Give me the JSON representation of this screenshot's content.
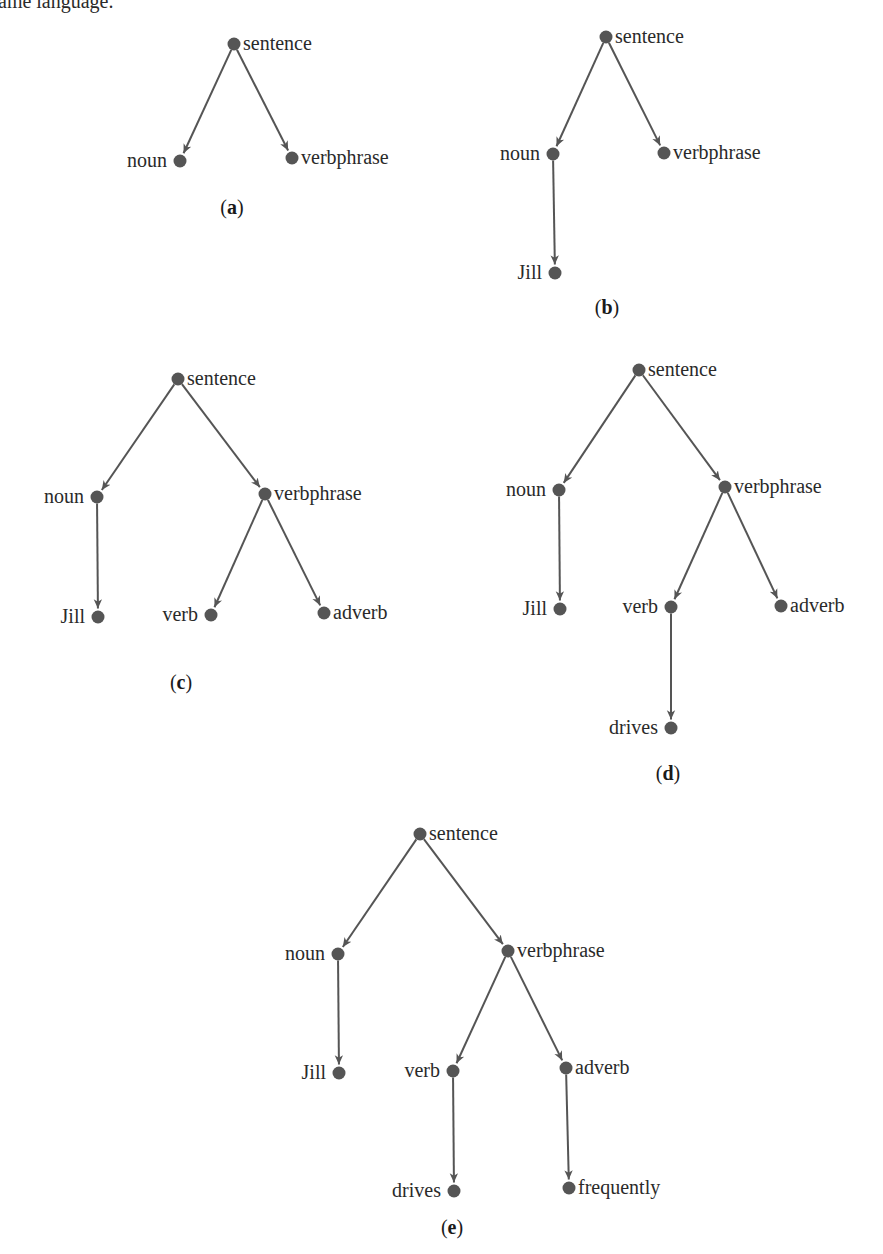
{
  "top_text": "ame language.",
  "colors": {
    "edge": "#555555",
    "node": "#555555",
    "text": "#2a2a2a"
  },
  "trees": [
    {
      "id": "a",
      "caption": "a",
      "caption_pos": [
        232,
        208
      ],
      "nodes": [
        {
          "id": "sentence",
          "label": "sentence",
          "x": 234,
          "y": 44,
          "side": "right"
        },
        {
          "id": "noun",
          "label": "noun",
          "x": 180,
          "y": 161,
          "side": "left"
        },
        {
          "id": "verbphrase",
          "label": "verbphrase",
          "x": 292,
          "y": 158,
          "side": "right"
        }
      ],
      "edges": [
        [
          "sentence",
          "noun"
        ],
        [
          "sentence",
          "verbphrase"
        ]
      ]
    },
    {
      "id": "b",
      "caption": "b",
      "caption_pos": [
        607,
        308
      ],
      "nodes": [
        {
          "id": "sentence",
          "label": "sentence",
          "x": 606,
          "y": 37,
          "side": "right"
        },
        {
          "id": "noun",
          "label": "noun",
          "x": 553,
          "y": 154,
          "side": "left"
        },
        {
          "id": "verbphrase",
          "label": "verbphrase",
          "x": 664,
          "y": 153,
          "side": "right"
        },
        {
          "id": "jill",
          "label": "Jill",
          "x": 555,
          "y": 273,
          "side": "left"
        }
      ],
      "edges": [
        [
          "sentence",
          "noun"
        ],
        [
          "sentence",
          "verbphrase"
        ],
        [
          "noun",
          "jill"
        ]
      ]
    },
    {
      "id": "c",
      "caption": "c",
      "caption_pos": [
        181,
        683
      ],
      "nodes": [
        {
          "id": "sentence",
          "label": "sentence",
          "x": 178,
          "y": 379,
          "side": "right"
        },
        {
          "id": "noun",
          "label": "noun",
          "x": 97,
          "y": 497,
          "side": "left"
        },
        {
          "id": "verbphrase",
          "label": "verbphrase",
          "x": 265,
          "y": 494,
          "side": "right"
        },
        {
          "id": "jill",
          "label": "Jill",
          "x": 98,
          "y": 617,
          "side": "left"
        },
        {
          "id": "verb",
          "label": "verb",
          "x": 211,
          "y": 615,
          "side": "left"
        },
        {
          "id": "adverb",
          "label": "adverb",
          "x": 324,
          "y": 613,
          "side": "right"
        }
      ],
      "edges": [
        [
          "sentence",
          "noun"
        ],
        [
          "sentence",
          "verbphrase"
        ],
        [
          "noun",
          "jill"
        ],
        [
          "verbphrase",
          "verb"
        ],
        [
          "verbphrase",
          "adverb"
        ]
      ]
    },
    {
      "id": "d",
      "caption": "d",
      "caption_pos": [
        668,
        774
      ],
      "nodes": [
        {
          "id": "sentence",
          "label": "sentence",
          "x": 639,
          "y": 370,
          "side": "right"
        },
        {
          "id": "noun",
          "label": "noun",
          "x": 559,
          "y": 490,
          "side": "left"
        },
        {
          "id": "verbphrase",
          "label": "verbphrase",
          "x": 725,
          "y": 487,
          "side": "right"
        },
        {
          "id": "jill",
          "label": "Jill",
          "x": 560,
          "y": 609,
          "side": "left"
        },
        {
          "id": "verb",
          "label": "verb",
          "x": 671,
          "y": 607,
          "side": "left"
        },
        {
          "id": "adverb",
          "label": "adverb",
          "x": 781,
          "y": 606,
          "side": "right"
        },
        {
          "id": "drives",
          "label": "drives",
          "x": 671,
          "y": 728,
          "side": "left"
        }
      ],
      "edges": [
        [
          "sentence",
          "noun"
        ],
        [
          "sentence",
          "verbphrase"
        ],
        [
          "noun",
          "jill"
        ],
        [
          "verbphrase",
          "verb"
        ],
        [
          "verbphrase",
          "adverb"
        ],
        [
          "verb",
          "drives"
        ]
      ]
    },
    {
      "id": "e",
      "caption": "e",
      "caption_pos": [
        452,
        1228
      ],
      "nodes": [
        {
          "id": "sentence",
          "label": "sentence",
          "x": 420,
          "y": 834,
          "side": "right"
        },
        {
          "id": "noun",
          "label": "noun",
          "x": 338,
          "y": 954,
          "side": "left"
        },
        {
          "id": "verbphrase",
          "label": "verbphrase",
          "x": 508,
          "y": 951,
          "side": "right"
        },
        {
          "id": "jill",
          "label": "Jill",
          "x": 339,
          "y": 1073,
          "side": "left"
        },
        {
          "id": "verb",
          "label": "verb",
          "x": 453,
          "y": 1071,
          "side": "left"
        },
        {
          "id": "adverb",
          "label": "adverb",
          "x": 566,
          "y": 1068,
          "side": "right"
        },
        {
          "id": "drives",
          "label": "drives",
          "x": 454,
          "y": 1191,
          "side": "left"
        },
        {
          "id": "frequently",
          "label": "frequently",
          "x": 569,
          "y": 1188,
          "side": "right"
        }
      ],
      "edges": [
        [
          "sentence",
          "noun"
        ],
        [
          "sentence",
          "verbphrase"
        ],
        [
          "noun",
          "jill"
        ],
        [
          "verbphrase",
          "verb"
        ],
        [
          "verbphrase",
          "adverb"
        ],
        [
          "verb",
          "drives"
        ],
        [
          "adverb",
          "frequently"
        ]
      ]
    }
  ]
}
